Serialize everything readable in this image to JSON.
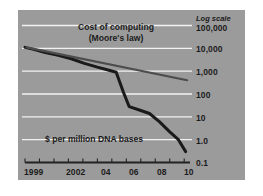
{
  "figure": {
    "panel_color": "#9b9b9b",
    "background_color": "#ffffff",
    "gridline_color": "#f2f2f2",
    "axis_color": "#222222"
  },
  "axes": {
    "log_scale_note": "Log scale",
    "y_ticks": [
      "100,000",
      "10,000",
      "1,000",
      "100",
      "10",
      "1.0",
      "0.1"
    ],
    "x_ticks": [
      "1999",
      "2002",
      "04",
      "06",
      "08",
      "10"
    ]
  },
  "annotations": {
    "moore_line1": "Cost of computing",
    "moore_line2": "(Moore's law)",
    "dna_label": "$ per million DNA bases"
  },
  "chart_data": {
    "type": "line",
    "title": "",
    "subtitle": "",
    "xlabel": "",
    "ylabel": "",
    "log_y": true,
    "ylim": [
      0.1,
      100000
    ],
    "xlim": [
      1999,
      2010.4
    ],
    "grid": true,
    "legend": "inline-annotations",
    "y_tick_values": [
      100000,
      10000,
      1000,
      100,
      10,
      1.0,
      0.1
    ],
    "y_tick_labels": [
      "100,000",
      "10,000",
      "1,000",
      "100",
      "10",
      "1.0",
      "0.1"
    ],
    "x_tick_values": [
      1999,
      2002,
      2004,
      2006,
      2008,
      2010
    ],
    "x_tick_labels": [
      "1999",
      "2002",
      "04",
      "06",
      "08",
      "10"
    ],
    "x_minor_ticks": [
      1999,
      2000,
      2001,
      2002,
      2003,
      2004,
      2005,
      2006,
      2007,
      2008,
      2009,
      2010
    ],
    "series": [
      {
        "name": "$ per million DNA bases",
        "color": "#1a1a1a",
        "width": 3.0,
        "x": [
          1999,
          1999.6,
          2000.4,
          2001.3,
          2002.2,
          2003.1,
          2004.0,
          2004.8,
          2005.3,
          2005.8,
          2006.2,
          2006.9,
          2007.6,
          2008.3,
          2009.0,
          2009.6,
          2010.1
        ],
        "values": [
          11000,
          9000,
          6500,
          5000,
          3500,
          2200,
          1500,
          1100,
          900,
          120,
          28,
          20,
          14,
          6.0,
          2.2,
          1.0,
          0.3
        ]
      },
      {
        "name": "Cost of computing (Moore's law)",
        "color": "#4d4d4d",
        "width": 2.2,
        "x": [
          1999.1,
          2010.2
        ],
        "values": [
          11000,
          400
        ]
      }
    ],
    "annotations": [
      {
        "text": "Cost of computing",
        "x": 2002.8,
        "y": 42000
      },
      {
        "text": "(Moore's law)",
        "x": 2002.8,
        "y": 24000
      },
      {
        "text": "$ per million DNA bases",
        "x": 2002.2,
        "y": 2.6
      },
      {
        "text": "Log scale",
        "x": 2010.6,
        "y": 300000
      }
    ]
  }
}
